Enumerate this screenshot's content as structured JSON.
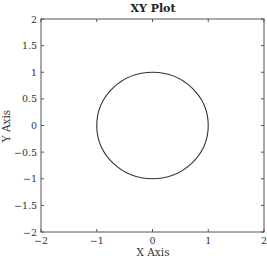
{
  "chart_data": {
    "type": "line",
    "title": "XY Plot",
    "xlabel": "X Axis",
    "ylabel": "Y Axis",
    "xlim": [
      -2,
      2
    ],
    "ylim": [
      -2,
      2
    ],
    "xticks": [
      -2,
      -1,
      0,
      1,
      2
    ],
    "yticks": [
      -2,
      -1.5,
      -1,
      -0.5,
      0,
      0.5,
      1,
      1.5,
      2
    ],
    "xtick_labels": [
      "−2",
      "−1",
      "0",
      "1",
      "2"
    ],
    "ytick_labels": [
      "−2",
      "−1.5",
      "−1",
      "−0.5",
      "0",
      "0.5",
      "1",
      "1.5",
      "2"
    ],
    "grid": false,
    "legend": null,
    "series": [
      {
        "name": "unit circle",
        "shape": "circle",
        "center": [
          0,
          0
        ],
        "radius": 1,
        "color": "#333333",
        "x": [
          1,
          0.866,
          0.5,
          0,
          -0.5,
          -0.866,
          -1,
          -0.866,
          -0.5,
          0,
          0.5,
          0.866,
          1
        ],
        "y": [
          0,
          0.5,
          0.866,
          1,
          0.866,
          0.5,
          0,
          -0.5,
          -0.866,
          -1,
          -0.866,
          -0.5,
          0
        ]
      }
    ]
  }
}
